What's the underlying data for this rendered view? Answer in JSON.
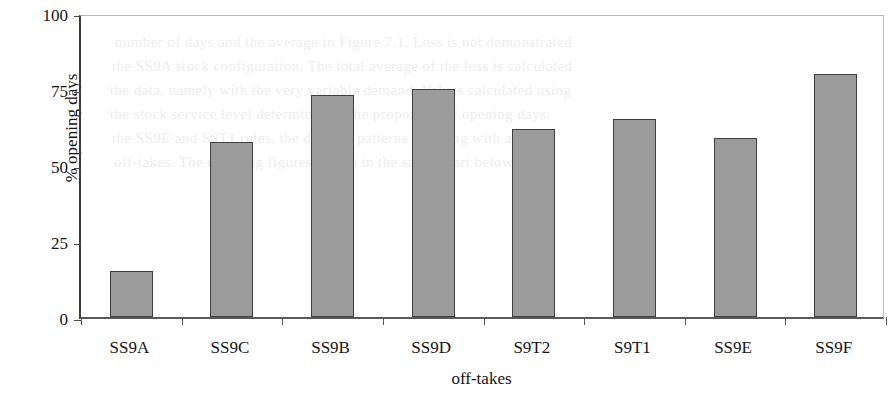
{
  "chart_data": {
    "type": "bar",
    "title": "",
    "xlabel": "off-takes",
    "ylabel": "% opening days",
    "categories": [
      "SS9A",
      "SS9C",
      "SS9B",
      "SS9D",
      "S9T2",
      "S9T1",
      "SS9E",
      "SS9F"
    ],
    "values": [
      15,
      57.5,
      73,
      75,
      62,
      65,
      59,
      80
    ],
    "ylim": [
      0,
      100
    ],
    "yticks": [
      0,
      25,
      50,
      75,
      100
    ],
    "ytick_labels": [
      "0",
      "25",
      "50",
      "75",
      "100"
    ],
    "grid": false,
    "legend": null,
    "bar_color": "#9b9b9b",
    "bar_edge_color": "#3f3f3f",
    "axis_color": "#4a4a4a"
  },
  "axes": {
    "y_title": "% opening days",
    "x_title": "off-takes"
  },
  "ghost_text": [
    "number of days and the average in Figure 7.1. Loss is not demonstrated",
    "the SS9A stock configuration. The total average of the loss is calculated",
    "the data, namely with the very variable demand. Values calculated using",
    "the stock service level determined as the proportion of opening days.",
    "the SS9E and S9T1 rules, the demand patterns resulting with all the",
    "off-takes. The resulting figures shown in the same chart below."
  ]
}
